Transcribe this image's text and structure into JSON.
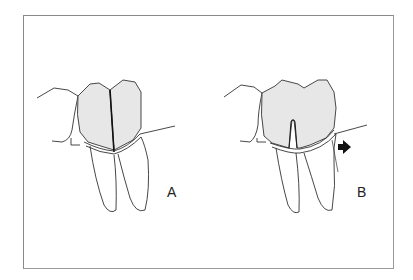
{
  "figure": {
    "panels": [
      {
        "id": "A",
        "label": "A",
        "description": "Two-rooted molar, crown split into two halves by a vertical fracture line"
      },
      {
        "id": "B",
        "label": "B",
        "description": "Two-rooted molar with furcation notch and arrow indicating direction"
      }
    ],
    "colors": {
      "frame": "#8a8a8a",
      "line": "#333333",
      "crown_fill": "#e6e6e6",
      "arrow": "#111111",
      "background": "#ffffff"
    },
    "arrow": {
      "icon": "right-arrow-icon",
      "glyph": "➡"
    }
  }
}
